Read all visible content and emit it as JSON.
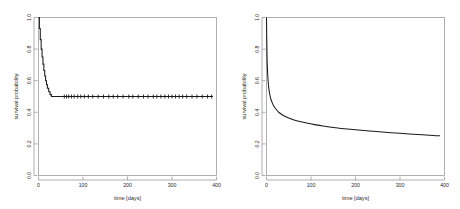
{
  "figure": {
    "background_color": "#ffffff",
    "curve_color": "#1a1a1a",
    "axis_color": "#8e8e8e",
    "panel_count": 2
  },
  "chart_data": [
    {
      "type": "line",
      "title": "",
      "subtitle": "",
      "panel": "left",
      "panel_label": "Kaplan-Meier survival estimate",
      "xlabel": "time [days]",
      "ylabel": "survival probability",
      "xlim": [
        0,
        400
      ],
      "ylim": [
        0.0,
        1.0
      ],
      "xticks": [
        0,
        100,
        200,
        300,
        400
      ],
      "xticklabels": [
        "0",
        "100",
        "200",
        "300",
        "400"
      ],
      "yticks": [
        0.0,
        0.2,
        0.4,
        0.6,
        0.8,
        1.0
      ],
      "yticklabels": [
        "0.0",
        "0.2",
        "0.4",
        "0.6",
        "0.8",
        "1.0"
      ],
      "grid": false,
      "legend": "none",
      "step": true,
      "annotations": [
        "censoring tick marks along curve"
      ],
      "x": [
        0,
        2,
        4,
        6,
        8,
        10,
        12,
        14,
        16,
        18,
        20,
        23,
        26,
        29,
        32,
        35,
        38,
        42,
        46,
        50,
        55,
        60,
        66,
        72,
        78,
        85,
        92,
        100,
        110,
        120,
        130,
        140,
        150,
        160,
        170,
        185,
        200,
        220,
        240,
        260,
        280,
        300,
        320,
        340,
        360,
        380,
        392
      ],
      "y": [
        1.0,
        0.93,
        0.86,
        0.8,
        0.75,
        0.705,
        0.665,
        0.63,
        0.6,
        0.575,
        0.552,
        0.53,
        0.512,
        0.498,
        0.487,
        0.478,
        0.471,
        0.464,
        0.459,
        0.456,
        0.524,
        0.522,
        0.52,
        0.519,
        0.518,
        0.517,
        0.517,
        0.516,
        0.515,
        0.515,
        0.514,
        0.514,
        0.513,
        0.513,
        0.512,
        0.512,
        0.512,
        0.511,
        0.511,
        0.511,
        0.51,
        0.51,
        0.51,
        0.51,
        0.51,
        0.51,
        0.51
      ],
      "censor_times": [
        58,
        63,
        68,
        74,
        80,
        88,
        95,
        103,
        112,
        122,
        134,
        146,
        158,
        168,
        178,
        190,
        203,
        212,
        224,
        236,
        246,
        258,
        266,
        275,
        284,
        292,
        300,
        308,
        316,
        324,
        333,
        345,
        356,
        368,
        380,
        389
      ],
      "plateau_value": 0.5
    },
    {
      "type": "line",
      "title": "",
      "subtitle": "",
      "panel": "right",
      "panel_label": "Parametric survival curve",
      "xlabel": "time [days]",
      "ylabel": "survival probability",
      "xlim": [
        0,
        400
      ],
      "ylim": [
        0.0,
        1.0
      ],
      "xticks": [
        0,
        100,
        200,
        300,
        400
      ],
      "xticklabels": [
        "0",
        "100",
        "200",
        "300",
        "400"
      ],
      "yticks": [
        0.0,
        0.2,
        0.4,
        0.6,
        0.8,
        1.0
      ],
      "yticklabels": [
        "0.0",
        "0.2",
        "0.4",
        "0.6",
        "0.8",
        "1.0"
      ],
      "grid": false,
      "legend": "none",
      "step": false,
      "annotations": [],
      "x": [
        0,
        1,
        2,
        4,
        6,
        9,
        12,
        16,
        20,
        26,
        32,
        40,
        50,
        62,
        75,
        90,
        108,
        128,
        150,
        175,
        200,
        230,
        260,
        290,
        320,
        350,
        375,
        390
      ],
      "y": [
        1.0,
        0.78,
        0.68,
        0.585,
        0.535,
        0.492,
        0.466,
        0.441,
        0.424,
        0.405,
        0.391,
        0.377,
        0.364,
        0.352,
        0.342,
        0.332,
        0.322,
        0.313,
        0.304,
        0.296,
        0.289,
        0.282,
        0.275,
        0.269,
        0.263,
        0.258,
        0.253,
        0.251
      ],
      "end_value": 0.25
    }
  ]
}
